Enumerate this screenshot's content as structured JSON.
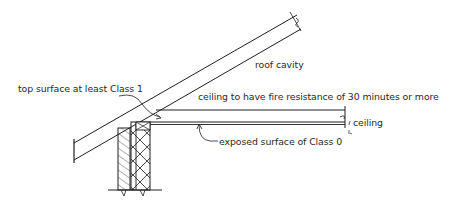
{
  "diagram": {
    "labels": {
      "roof_cavity": "roof cavity",
      "top_surface": "top surface at least Class 1",
      "fire_resistance": "ceiling to have fire resistance of 30 minutes or more",
      "ceiling": "ceiling",
      "exposed_surface": "exposed surface of Class 0"
    },
    "colors": {
      "line": "#1e1e1e",
      "background": "#ffffff"
    },
    "components": [
      "roof-rafter",
      "ceiling-joist",
      "ceiling-lining",
      "masonry-wall",
      "timber-wall-plate",
      "ground-line"
    ]
  }
}
